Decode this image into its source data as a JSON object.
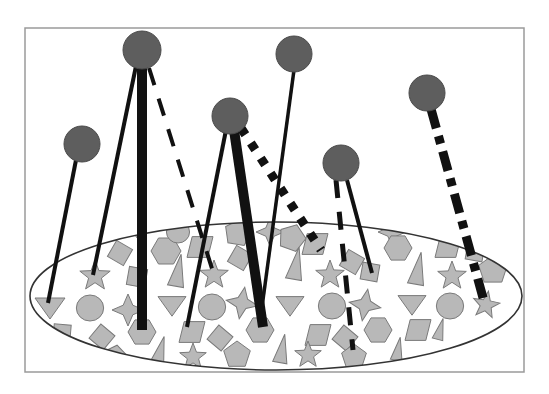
{
  "canvas": {
    "width": 549,
    "height": 394,
    "background": "#ffffff"
  },
  "frame": {
    "x": 25,
    "y": 28,
    "width": 499,
    "height": 344,
    "stroke": "#9a9a9a",
    "stroke_width": 1.5
  },
  "colors": {
    "ball_fill": "#5e5e5e",
    "ball_stroke": "#4a4a4a",
    "line": "#111111",
    "shape_fill": "#b8b8b8",
    "shape_stroke": "#7a7a7a",
    "ellipse_stroke": "#333333",
    "ellipse_fill": "#ffffff"
  },
  "population": {
    "ellipse": {
      "cx": 276,
      "cy": 296,
      "rx": 246,
      "ry": 74
    },
    "shapes": [
      {
        "type": "pentagon",
        "x": 238,
        "y": 233,
        "r": 14,
        "rot": 10
      },
      {
        "type": "hexagon",
        "x": 166,
        "y": 251,
        "r": 15,
        "rot": 0
      },
      {
        "type": "square",
        "x": 120,
        "y": 253,
        "r": 13,
        "rot": 30
      },
      {
        "type": "triangle-up",
        "x": 178,
        "y": 272,
        "r": 18,
        "rot": 10
      },
      {
        "type": "square",
        "x": 137,
        "y": 277,
        "r": 13,
        "rot": 10
      },
      {
        "type": "star",
        "x": 95,
        "y": 276,
        "r": 16,
        "rot": 0
      },
      {
        "type": "triangle-down",
        "x": 50,
        "y": 307,
        "r": 15,
        "rot": 0
      },
      {
        "type": "circle",
        "x": 90,
        "y": 308,
        "r": 13,
        "rot": 0
      },
      {
        "type": "star4",
        "x": 128,
        "y": 310,
        "r": 16,
        "rot": 0
      },
      {
        "type": "triangle-down",
        "x": 172,
        "y": 305,
        "r": 14,
        "rot": 0
      },
      {
        "type": "square",
        "x": 62,
        "y": 333,
        "r": 12,
        "rot": 5
      },
      {
        "type": "square",
        "x": 102,
        "y": 337,
        "r": 13,
        "rot": 40
      },
      {
        "type": "hexagon",
        "x": 142,
        "y": 332,
        "r": 14,
        "rot": 0
      },
      {
        "type": "pentagon",
        "x": 115,
        "y": 357,
        "r": 12,
        "rot": 10
      },
      {
        "type": "triangle-up",
        "x": 80,
        "y": 352,
        "r": 10,
        "rot": 0
      },
      {
        "type": "triangle-up",
        "x": 160,
        "y": 352,
        "r": 16,
        "rot": 15
      },
      {
        "type": "parallelogram",
        "x": 192,
        "y": 332,
        "r": 13,
        "rot": 0
      },
      {
        "type": "star",
        "x": 193,
        "y": 357,
        "r": 14,
        "rot": 0
      },
      {
        "type": "star",
        "x": 214,
        "y": 275,
        "r": 15,
        "rot": 0
      },
      {
        "type": "parallelogram",
        "x": 200,
        "y": 247,
        "r": 13,
        "rot": 0
      },
      {
        "type": "circle",
        "x": 212,
        "y": 307,
        "r": 13,
        "rot": 0
      },
      {
        "type": "star4",
        "x": 242,
        "y": 303,
        "r": 16,
        "rot": 10
      },
      {
        "type": "square",
        "x": 240,
        "y": 258,
        "r": 13,
        "rot": 30
      },
      {
        "type": "hexagon",
        "x": 260,
        "y": 330,
        "r": 14,
        "rot": 0
      },
      {
        "type": "square",
        "x": 220,
        "y": 338,
        "r": 13,
        "rot": 40
      },
      {
        "type": "pentagon",
        "x": 237,
        "y": 355,
        "r": 14,
        "rot": 0
      },
      {
        "type": "triangle-up",
        "x": 282,
        "y": 350,
        "r": 16,
        "rot": 10
      },
      {
        "type": "star4",
        "x": 270,
        "y": 232,
        "r": 14,
        "rot": 0
      },
      {
        "type": "pentagon",
        "x": 292,
        "y": 238,
        "r": 14,
        "rot": 20
      },
      {
        "type": "triangle-up",
        "x": 296,
        "y": 265,
        "r": 18,
        "rot": 10
      },
      {
        "type": "triangle-down",
        "x": 290,
        "y": 305,
        "r": 14,
        "rot": 0
      },
      {
        "type": "parallelogram",
        "x": 318,
        "y": 335,
        "r": 13,
        "rot": 0
      },
      {
        "type": "star",
        "x": 308,
        "y": 355,
        "r": 14,
        "rot": 0
      },
      {
        "type": "parallelogram",
        "x": 315,
        "y": 244,
        "r": 13,
        "rot": 0
      },
      {
        "type": "star",
        "x": 330,
        "y": 275,
        "r": 15,
        "rot": 0
      },
      {
        "type": "circle",
        "x": 332,
        "y": 306,
        "r": 13,
        "rot": 0
      },
      {
        "type": "square",
        "x": 352,
        "y": 262,
        "r": 13,
        "rot": 30
      },
      {
        "type": "square",
        "x": 370,
        "y": 272,
        "r": 12,
        "rot": 10
      },
      {
        "type": "star4",
        "x": 365,
        "y": 305,
        "r": 16,
        "rot": 10
      },
      {
        "type": "hexagon",
        "x": 378,
        "y": 330,
        "r": 14,
        "rot": 0
      },
      {
        "type": "square",
        "x": 345,
        "y": 338,
        "r": 13,
        "rot": 40
      },
      {
        "type": "pentagon",
        "x": 354,
        "y": 357,
        "r": 13,
        "rot": 0
      },
      {
        "type": "star4",
        "x": 392,
        "y": 232,
        "r": 14,
        "rot": 0
      },
      {
        "type": "hexagon",
        "x": 398,
        "y": 248,
        "r": 14,
        "rot": 0
      },
      {
        "type": "triangle-up",
        "x": 418,
        "y": 270,
        "r": 18,
        "rot": 10
      },
      {
        "type": "triangle-down",
        "x": 412,
        "y": 304,
        "r": 14,
        "rot": 0
      },
      {
        "type": "parallelogram",
        "x": 418,
        "y": 330,
        "r": 13,
        "rot": 0
      },
      {
        "type": "triangle-up",
        "x": 398,
        "y": 350,
        "r": 13,
        "rot": 10
      },
      {
        "type": "parallelogram",
        "x": 448,
        "y": 247,
        "r": 13,
        "rot": 0
      },
      {
        "type": "star",
        "x": 452,
        "y": 276,
        "r": 15,
        "rot": 0
      },
      {
        "type": "circle",
        "x": 450,
        "y": 306,
        "r": 13,
        "rot": 0
      },
      {
        "type": "triangle-up",
        "x": 440,
        "y": 330,
        "r": 12,
        "rot": 15
      },
      {
        "type": "square",
        "x": 475,
        "y": 252,
        "r": 12,
        "rot": 10
      },
      {
        "type": "pentagon",
        "x": 493,
        "y": 270,
        "r": 15,
        "rot": 0
      },
      {
        "type": "star",
        "x": 486,
        "y": 305,
        "r": 14,
        "rot": 10
      },
      {
        "type": "circle",
        "x": 178,
        "y": 232,
        "r": 11,
        "rot": 0
      },
      {
        "type": "triangle-down",
        "x": 138,
        "y": 232,
        "r": 9,
        "rot": 0
      }
    ]
  },
  "samplers": [
    {
      "id": "ball-1",
      "x": 82,
      "y": 144,
      "r": 18
    },
    {
      "id": "ball-2",
      "x": 142,
      "y": 50,
      "r": 19
    },
    {
      "id": "ball-3",
      "x": 230,
      "y": 116,
      "r": 18
    },
    {
      "id": "ball-4",
      "x": 294,
      "y": 54,
      "r": 18
    },
    {
      "id": "ball-5",
      "x": 341,
      "y": 163,
      "r": 18
    },
    {
      "id": "ball-6",
      "x": 427,
      "y": 93,
      "r": 18
    }
  ],
  "connections": [
    {
      "from": [
        76,
        160
      ],
      "to": [
        48,
        303
      ],
      "width": 4,
      "dash": ""
    },
    {
      "from": [
        136,
        66
      ],
      "to": [
        93,
        275
      ],
      "width": 4,
      "dash": ""
    },
    {
      "from": [
        142,
        66
      ],
      "to": [
        142,
        330
      ],
      "width": 10,
      "dash": ""
    },
    {
      "from": [
        149,
        68
      ],
      "to": [
        214,
        275
      ],
      "width": 4,
      "dash": "18 14"
    },
    {
      "from": [
        226,
        130
      ],
      "to": [
        187,
        327
      ],
      "width": 4,
      "dash": ""
    },
    {
      "from": [
        234,
        130
      ],
      "to": [
        263,
        327
      ],
      "width": 10,
      "dash": ""
    },
    {
      "from": [
        241,
        128
      ],
      "to": [
        321,
        250
      ],
      "width": 9,
      "dash": "8 10"
    },
    {
      "from": [
        294,
        70
      ],
      "to": [
        260,
        322
      ],
      "width": 3.5,
      "dash": ""
    },
    {
      "from": [
        336,
        180
      ],
      "to": [
        353,
        350
      ],
      "width": 5,
      "dash": "18 14"
    },
    {
      "from": [
        347,
        180
      ],
      "to": [
        372,
        273
      ],
      "width": 4,
      "dash": ""
    },
    {
      "from": [
        431,
        109
      ],
      "to": [
        485,
        305
      ],
      "width": 9,
      "dash": "20 8 8 8"
    }
  ]
}
